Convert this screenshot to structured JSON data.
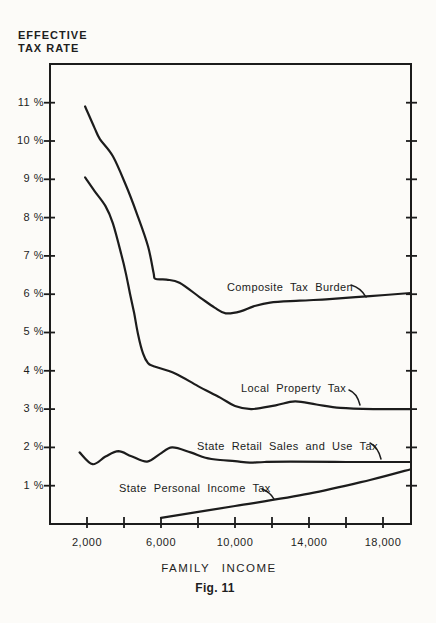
{
  "figure": {
    "y_axis_title_line1": "EFFECTIVE",
    "y_axis_title_line2": "TAX RATE",
    "x_axis_title": "FAMILY INCOME",
    "caption": "Fig. 11"
  },
  "colors": {
    "ink": "#1c1c1c",
    "paper": "#fcfbf8"
  },
  "chart_data": {
    "type": "line",
    "title": "",
    "xlabel": "FAMILY INCOME",
    "ylabel": "EFFECTIVE TAX RATE",
    "caption": "Fig. 11",
    "grid": false,
    "frame": true,
    "legend": "inline-labels-with-pointers",
    "x_axis": {
      "range": [
        0,
        19514
      ],
      "ticks_all": [
        2000,
        4000,
        6000,
        8000,
        10000,
        12000,
        14000,
        16000,
        18000
      ],
      "labeled": [
        {
          "value": 2000,
          "label": "2,000"
        },
        {
          "value": 6000,
          "label": "6,000"
        },
        {
          "value": 10000,
          "label": "10,000"
        },
        {
          "value": 14000,
          "label": "14,000"
        },
        {
          "value": 18000,
          "label": "18,000"
        }
      ]
    },
    "y_axis": {
      "range": [
        0,
        12.01
      ],
      "unit": "%",
      "ticks": [
        {
          "value": 1,
          "label": "1 %"
        },
        {
          "value": 2,
          "label": "2 %"
        },
        {
          "value": 3,
          "label": "3 %"
        },
        {
          "value": 4,
          "label": "4 %"
        },
        {
          "value": 5,
          "label": "5 %"
        },
        {
          "value": 6,
          "label": "6 %"
        },
        {
          "value": 7,
          "label": "7 %"
        },
        {
          "value": 8,
          "label": "8 %"
        },
        {
          "value": 9,
          "label": "9 %"
        },
        {
          "value": 10,
          "label": "10 %"
        },
        {
          "value": 11,
          "label": "11 %"
        }
      ]
    },
    "series": [
      {
        "name": "Composite Tax Burden",
        "points": [
          [
            1900,
            10.9
          ],
          [
            2400,
            10.35
          ],
          [
            2700,
            10.05
          ],
          [
            3400,
            9.6
          ],
          [
            4100,
            8.85
          ],
          [
            4700,
            8.1
          ],
          [
            5300,
            7.25
          ],
          [
            5600,
            6.55
          ],
          [
            5700,
            6.4
          ],
          [
            6300,
            6.38
          ],
          [
            7000,
            6.3
          ],
          [
            8100,
            5.92
          ],
          [
            8900,
            5.65
          ],
          [
            9500,
            5.5
          ],
          [
            10300,
            5.55
          ],
          [
            11000,
            5.68
          ],
          [
            11900,
            5.78
          ],
          [
            13500,
            5.83
          ],
          [
            15100,
            5.87
          ],
          [
            17300,
            5.95
          ],
          [
            19500,
            6.03
          ]
        ]
      },
      {
        "name": "Local Property Tax",
        "points": [
          [
            1900,
            9.05
          ],
          [
            2400,
            8.7
          ],
          [
            3000,
            8.3
          ],
          [
            3400,
            7.85
          ],
          [
            3850,
            7.05
          ],
          [
            4100,
            6.55
          ],
          [
            4330,
            6.0
          ],
          [
            4550,
            5.5
          ],
          [
            4760,
            4.95
          ],
          [
            5030,
            4.45
          ],
          [
            5300,
            4.2
          ],
          [
            5600,
            4.12
          ],
          [
            6760,
            3.93
          ],
          [
            8000,
            3.6
          ],
          [
            9200,
            3.3
          ],
          [
            10000,
            3.08
          ],
          [
            10900,
            3.0
          ],
          [
            12200,
            3.1
          ],
          [
            13250,
            3.2
          ],
          [
            14400,
            3.12
          ],
          [
            15700,
            3.03
          ],
          [
            17500,
            3.0
          ],
          [
            19500,
            3.0
          ]
        ]
      },
      {
        "name": "State Retail Sales and Use Tax",
        "points": [
          [
            1600,
            1.87
          ],
          [
            2300,
            1.56
          ],
          [
            3000,
            1.76
          ],
          [
            3700,
            1.9
          ],
          [
            4400,
            1.77
          ],
          [
            5250,
            1.63
          ],
          [
            5950,
            1.83
          ],
          [
            6600,
            2.0
          ],
          [
            7600,
            1.87
          ],
          [
            8400,
            1.73
          ],
          [
            9200,
            1.67
          ],
          [
            10000,
            1.64
          ],
          [
            10800,
            1.6
          ],
          [
            11600,
            1.62
          ],
          [
            13000,
            1.63
          ],
          [
            16000,
            1.62
          ],
          [
            19500,
            1.62
          ]
        ]
      },
      {
        "name": "State Personal Income Tax",
        "points": [
          [
            6000,
            0.16
          ],
          [
            10000,
            0.47
          ],
          [
            14000,
            0.79
          ],
          [
            17300,
            1.15
          ],
          [
            19500,
            1.43
          ]
        ]
      }
    ],
    "layout": {
      "plot_box": [
        50,
        64,
        411,
        524
      ],
      "tick_style": "crossing",
      "right_axis_mirror_ticks": true
    }
  }
}
